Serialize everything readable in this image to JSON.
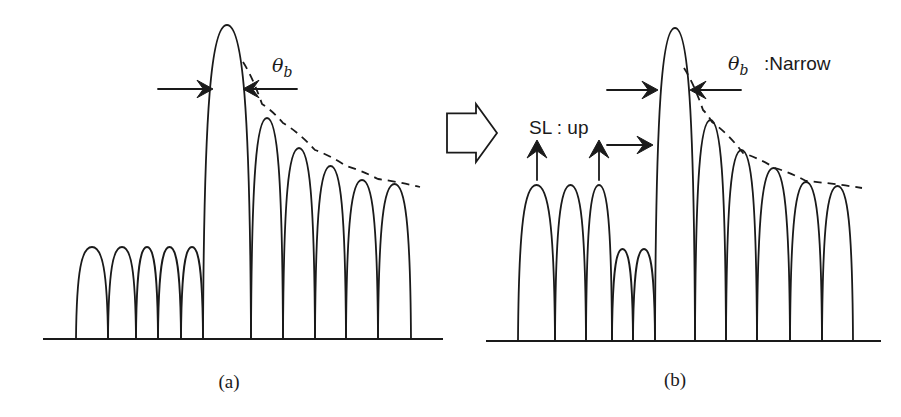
{
  "figure": {
    "panels": [
      {
        "id": "a",
        "caption": "(a)",
        "beamwidth_symbol": "θ",
        "beamwidth_subscript": "b",
        "beamwidth_note": "",
        "baseline": {
          "x1": 43,
          "x2": 443,
          "y": 339
        },
        "lobes": [
          {
            "x1": 76,
            "x2": 108,
            "peak_y": 247,
            "role": "sidelobe"
          },
          {
            "x1": 108,
            "x2": 136,
            "peak_y": 247,
            "role": "sidelobe"
          },
          {
            "x1": 136,
            "x2": 158,
            "peak_y": 247,
            "role": "sidelobe"
          },
          {
            "x1": 158,
            "x2": 181,
            "peak_y": 247,
            "role": "sidelobe"
          },
          {
            "x1": 181,
            "x2": 203,
            "peak_y": 247,
            "role": "sidelobe"
          },
          {
            "x1": 203,
            "x2": 251,
            "peak_y": 25,
            "role": "main"
          },
          {
            "x1": 251,
            "x2": 283,
            "peak_y": 118,
            "role": "sidelobe"
          },
          {
            "x1": 283,
            "x2": 315,
            "peak_y": 148,
            "role": "sidelobe"
          },
          {
            "x1": 315,
            "x2": 346,
            "peak_y": 166,
            "role": "sidelobe"
          },
          {
            "x1": 346,
            "x2": 378,
            "peak_y": 180,
            "role": "sidelobe"
          },
          {
            "x1": 378,
            "x2": 411,
            "peak_y": 184,
            "role": "sidelobe"
          }
        ],
        "envelope": [
          [
            243,
            62
          ],
          [
            262,
            104
          ],
          [
            283,
            123
          ],
          [
            315,
            150
          ],
          [
            346,
            166
          ],
          [
            378,
            179
          ],
          [
            420,
            187
          ]
        ],
        "beamwidth_arrows": {
          "y": 89,
          "left": {
            "from": 158,
            "to": 213
          },
          "right": {
            "from": 297,
            "to": 243
          }
        },
        "label_pos": {
          "theta_x": 272,
          "theta_y": 72,
          "caption_x": 229,
          "caption_y": 388
        }
      },
      {
        "id": "b",
        "caption": "(b)",
        "beamwidth_symbol": "θ",
        "beamwidth_subscript": "b",
        "beamwidth_note": ":Narrow",
        "sidelobe_note": "SL : up",
        "baseline": {
          "x1": 486,
          "x2": 881,
          "y": 341
        },
        "lobes": [
          {
            "x1": 518,
            "x2": 555,
            "peak_y": 185,
            "role": "sidelobe-raised"
          },
          {
            "x1": 555,
            "x2": 586,
            "peak_y": 185,
            "role": "sidelobe-raised"
          },
          {
            "x1": 586,
            "x2": 612,
            "peak_y": 185,
            "role": "sidelobe-raised"
          },
          {
            "x1": 612,
            "x2": 633,
            "peak_y": 249,
            "role": "sidelobe"
          },
          {
            "x1": 633,
            "x2": 655,
            "peak_y": 249,
            "role": "sidelobe"
          },
          {
            "x1": 655,
            "x2": 695,
            "peak_y": 28,
            "role": "main"
          },
          {
            "x1": 695,
            "x2": 726,
            "peak_y": 120,
            "role": "sidelobe"
          },
          {
            "x1": 726,
            "x2": 757,
            "peak_y": 150,
            "role": "sidelobe"
          },
          {
            "x1": 757,
            "x2": 790,
            "peak_y": 168,
            "role": "sidelobe"
          },
          {
            "x1": 790,
            "x2": 822,
            "peak_y": 182,
            "role": "sidelobe"
          },
          {
            "x1": 822,
            "x2": 853,
            "peak_y": 186,
            "role": "sidelobe"
          }
        ],
        "envelope": [
          [
            684,
            68
          ],
          [
            703,
            110
          ],
          [
            712,
            122
          ],
          [
            743,
            153
          ],
          [
            775,
            168
          ],
          [
            806,
            181
          ],
          [
            862,
            188
          ]
        ],
        "beamwidth_arrows": {
          "y": 90,
          "left": {
            "from": 607,
            "to": 658
          },
          "right": {
            "from": 741,
            "to": 690
          }
        },
        "extra_arrows": [
          {
            "type": "up",
            "x": 537,
            "from": 180,
            "to": 140
          },
          {
            "type": "up",
            "x": 599,
            "from": 180,
            "to": 140
          },
          {
            "type": "right",
            "y": 145,
            "from": 607,
            "to": 653
          }
        ],
        "label_pos": {
          "theta_x": 728,
          "theta_y": 70,
          "note_x": 764,
          "sl_x": 529,
          "sl_y": 134,
          "caption_x": 675,
          "caption_y": 386
        }
      }
    ],
    "transition_arrow": {
      "x": 447,
      "y": 104,
      "width": 50,
      "height": 58,
      "style": "hollow-block-arrow"
    }
  },
  "icons": {
    "transition": "hollow-right-arrow-icon",
    "beamwidth_indicator": "converging-arrows-icon",
    "sidelobe_raise": "up-arrow-icon"
  }
}
